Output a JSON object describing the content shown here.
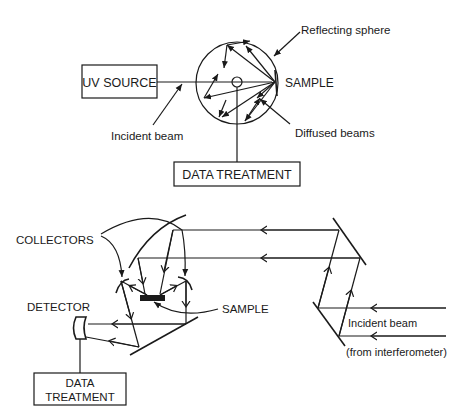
{
  "top_diagram": {
    "source_box": "UV SOURCE",
    "sphere_label": "Reflecting sphere",
    "sample_label": "SAMPLE",
    "incident_label": "Incident beam",
    "diffused_label": "Diffused beams",
    "treatment_box": "DATA TREATMENT"
  },
  "bottom_diagram": {
    "collectors_label": "COLLECTORS",
    "detector_label": "DETECTOR",
    "sample_label": "SAMPLE",
    "incident_label": "Incident beam",
    "interferometer_label": "(from interferometer)",
    "treatment_line1": "DATA",
    "treatment_line2": "TREATMENT"
  },
  "colors": {
    "ink": "#1a1a1a",
    "background": "#ffffff"
  }
}
